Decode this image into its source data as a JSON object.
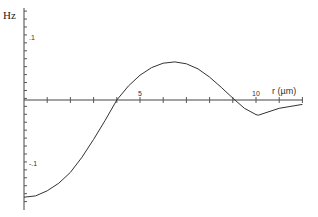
{
  "chart_data": {
    "type": "line",
    "title": "",
    "ylabel": "Hz",
    "xlabel": "r (µm)",
    "xlim": [
      0,
      12.3
    ],
    "ylim": [
      -0.16,
      0.145
    ],
    "x_tick_labels": [
      {
        "value": 5,
        "label": "5"
      },
      {
        "value": 10,
        "label": "10"
      }
    ],
    "y_tick_labels": [
      {
        "value": 0.1,
        "label": ".1"
      },
      {
        "value": -0.1,
        "label": "-.1"
      }
    ],
    "grid": false,
    "series": [
      {
        "name": "Hz",
        "x": [
          0,
          0.5,
          1,
          1.5,
          2,
          2.5,
          3,
          3.5,
          4,
          4.5,
          5,
          5.5,
          6,
          6.5,
          7,
          7.5,
          8,
          8.5,
          9,
          9.5,
          10,
          10.1,
          11,
          12
        ],
        "y": [
          -0.153,
          -0.151,
          -0.143,
          -0.131,
          -0.114,
          -0.09,
          -0.062,
          -0.032,
          0.0,
          0.022,
          0.039,
          0.051,
          0.058,
          0.06,
          0.057,
          0.049,
          0.036,
          0.02,
          0.003,
          -0.013,
          -0.023,
          -0.024,
          -0.013,
          -0.007
        ]
      }
    ]
  },
  "labels": {
    "y_axis": "Hz",
    "x_axis": "r (µm)",
    "tick_5": "5",
    "tick_10": "10",
    "tick_p1": ".1",
    "tick_m1": "-.1"
  }
}
